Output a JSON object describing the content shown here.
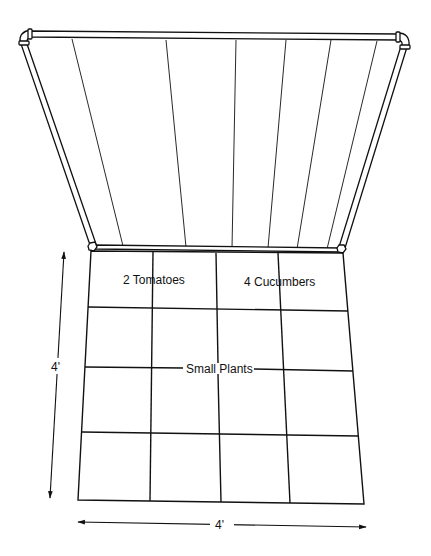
{
  "diagram": {
    "colors": {
      "line": "#111111",
      "background": "#ffffff"
    },
    "trellis": {
      "slats": 7,
      "frame": "pipe frame with elbow joints"
    },
    "grid": {
      "rows": 4,
      "cols": 4,
      "labels": {
        "tomatoes": "2 Tomatoes",
        "cucumbers": "4 Cucumbers",
        "small_plants": "Small Plants"
      }
    },
    "dimensions": {
      "height": "4'",
      "width": "4'"
    }
  }
}
